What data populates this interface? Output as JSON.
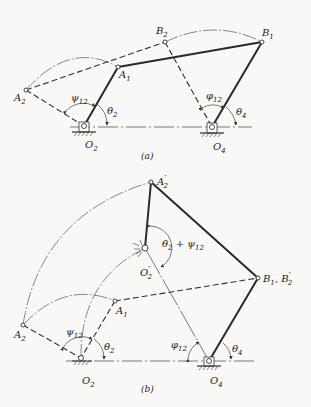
{
  "figure": {
    "part_a": {
      "caption": "(a)",
      "points": {
        "A1": {
          "label": "A",
          "sub": "1",
          "x": 118,
          "y": 67
        },
        "A2": {
          "label": "A",
          "sub": "2",
          "x": 26,
          "y": 90
        },
        "B1": {
          "label": "B",
          "sub": "1",
          "x": 262,
          "y": 42
        },
        "B2": {
          "label": "B",
          "sub": "2",
          "x": 165,
          "y": 42
        },
        "O2": {
          "label": "O",
          "sub": "2",
          "x": 84,
          "y": 126
        },
        "O4": {
          "label": "O",
          "sub": "4",
          "x": 212,
          "y": 127
        }
      },
      "angles": {
        "psi12": {
          "label": "ψ",
          "sub": "12"
        },
        "theta2": {
          "label": "θ",
          "sub": "2"
        },
        "phi12": {
          "label": "φ",
          "sub": "12"
        },
        "theta4": {
          "label": "θ",
          "sub": "4"
        }
      }
    },
    "part_b": {
      "caption": "(b)",
      "points": {
        "A2p": {
          "label": "A",
          "sub": "2",
          "prime": "′",
          "x": 151,
          "y": 182
        },
        "O2p": {
          "label": "O",
          "sub": "2",
          "prime": "′",
          "x": 145,
          "y": 248
        },
        "B1B2p": {
          "label": "B",
          "sub": "1",
          "label2": ", B",
          "sub2": "2",
          "prime": "′",
          "x": 258,
          "y": 278
        },
        "A1": {
          "label": "A",
          "sub": "1",
          "x": 115,
          "y": 301
        },
        "A2": {
          "label": "A",
          "sub": "2",
          "x": 23,
          "y": 325
        },
        "O2": {
          "label": "O",
          "sub": "2",
          "x": 81,
          "y": 358
        },
        "O4": {
          "label": "O",
          "sub": "4",
          "x": 209,
          "y": 361
        }
      },
      "angles": {
        "theta2_plus_psi12": {
          "label": "θ",
          "sub": "2",
          "mid": " + ψ",
          "sub2": "12"
        },
        "psi12": {
          "label": "ψ",
          "sub": "12"
        },
        "theta2": {
          "label": "θ",
          "sub": "2"
        },
        "phi12": {
          "label": "φ",
          "sub": "12"
        },
        "theta4": {
          "label": "θ",
          "sub": "4"
        }
      }
    }
  }
}
